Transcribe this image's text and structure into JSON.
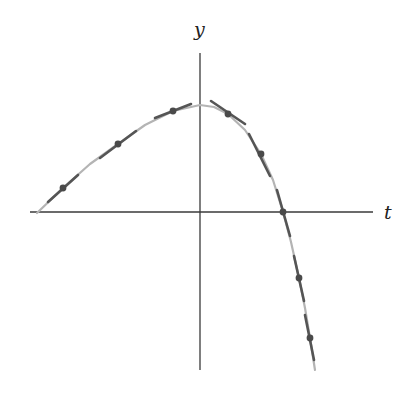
{
  "chart_data": {
    "type": "line",
    "title": "",
    "xlabel": "t",
    "ylabel": "y",
    "grid": false,
    "legend": null,
    "axes": {
      "origin_px": [
        200,
        212
      ],
      "x_axis_px": {
        "from": 30,
        "to": 373,
        "y": 212
      },
      "y_axis_px": {
        "x": 200,
        "from": 53,
        "to": 370
      }
    },
    "curve_px": [
      [
        37,
        213
      ],
      [
        63,
        188
      ],
      [
        90,
        164
      ],
      [
        118,
        144
      ],
      [
        145,
        125
      ],
      [
        173,
        111
      ],
      [
        200,
        105
      ],
      [
        214,
        107
      ],
      [
        228,
        114
      ],
      [
        245,
        130
      ],
      [
        261,
        154
      ],
      [
        273,
        180
      ],
      [
        283,
        212
      ],
      [
        291,
        242
      ],
      [
        299,
        278
      ],
      [
        305,
        308
      ],
      [
        310,
        338
      ],
      [
        315,
        370
      ]
    ],
    "points_px": [
      [
        63,
        188
      ],
      [
        118,
        144
      ],
      [
        173,
        111
      ],
      [
        228,
        114
      ],
      [
        261,
        154
      ],
      [
        283,
        212
      ],
      [
        299,
        278
      ],
      [
        310,
        338
      ]
    ],
    "tangent_segments_px": [
      [
        [
          48,
          202
        ],
        [
          78,
          175
        ]
      ],
      [
        [
          100,
          158
        ],
        [
          136,
          131
        ]
      ],
      [
        [
          155,
          118
        ],
        [
          191,
          104
        ]
      ],
      [
        [
          211,
          101
        ],
        [
          245,
          124
        ]
      ],
      [
        [
          249,
          134
        ],
        [
          270,
          176
        ]
      ],
      [
        [
          277,
          190
        ],
        [
          290,
          236
        ]
      ],
      [
        [
          294,
          256
        ],
        [
          304,
          301
        ]
      ],
      [
        [
          305,
          315
        ],
        [
          314,
          360
        ]
      ]
    ]
  },
  "labels": {
    "y_axis": "y",
    "t_axis": "t"
  },
  "colors": {
    "axis": "#3a3a3a",
    "curve": "#b4b4b4",
    "tangent": "#555555",
    "point": "#4a4a4a",
    "label": "#222222"
  }
}
